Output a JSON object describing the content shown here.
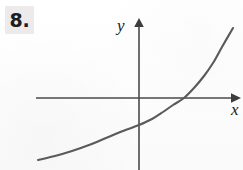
{
  "figure": {
    "problem_number": "8.",
    "background_color": "#fdfdfd",
    "ink_color": "#5a5a5a",
    "axis_color": "#4a4a4a",
    "number_box_color": "#eceaea"
  },
  "axes": {
    "y_label": "y",
    "x_label": "x",
    "x_axis": {
      "y_pixel": 98,
      "start_x": 36,
      "end_x": 240,
      "arrow": "right"
    },
    "y_axis": {
      "x_pixel": 139,
      "start_y": 22,
      "end_y": 170,
      "arrow": "up"
    }
  },
  "chart_data": {
    "type": "line",
    "title": "",
    "xlabel": "x",
    "ylabel": "y",
    "grid": false,
    "legend": null,
    "annotations": [],
    "series": [
      {
        "name": "exponential-curve",
        "x": [
          38,
          55,
          72,
          89,
          106,
          123,
          139,
          152,
          163,
          173,
          184,
          194,
          204,
          213,
          222,
          233
        ],
        "y": [
          160,
          156,
          151,
          145,
          138,
          131,
          125,
          119,
          112,
          105,
          98,
          88,
          76,
          63,
          47,
          28
        ]
      }
    ],
    "x_intercept_pixel": 184,
    "y_intercept_pixel": 125
  }
}
